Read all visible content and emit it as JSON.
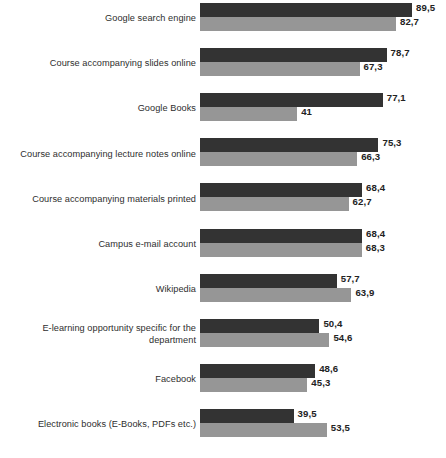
{
  "chart_data": {
    "type": "bar",
    "orientation": "horizontal",
    "title": "",
    "subtitle": "",
    "xlabel": "",
    "ylabel": "",
    "xlim": [
      0,
      100
    ],
    "grid": false,
    "legend": null,
    "decimal_separator": ",",
    "colors": {
      "series_1": "#333333",
      "series_2": "#969696",
      "background": "#ffffff",
      "label_text": "#2e2e2e",
      "value_text": "#222222"
    },
    "categories": [
      "Google search engine",
      "Course accompanying slides online",
      "Google Books",
      "Course accompanying lecture notes online",
      "Course accompanying materials printed",
      "Campus e-mail account",
      "Wikipedia",
      "E-learning opportunity specific for the department",
      "Facebook",
      "Electronic books (E-Books, PDFs etc.)"
    ],
    "series": [
      {
        "name": "series-1",
        "color": "#333333",
        "values": [
          89.5,
          78.7,
          77.1,
          75.3,
          68.4,
          68.4,
          57.7,
          50.4,
          48.6,
          39.5
        ],
        "labels": [
          "89,5",
          "78,7",
          "77,1",
          "75,3",
          "68,4",
          "68,4",
          "57,7",
          "50,4",
          "48,6",
          "39,5"
        ]
      },
      {
        "name": "series-2",
        "color": "#969696",
        "values": [
          82.7,
          67.3,
          41,
          66.3,
          62.7,
          68.3,
          63.9,
          54.6,
          45.3,
          53.5
        ],
        "labels": [
          "82,7",
          "67,3",
          "41",
          "66,3",
          "62,7",
          "68,3",
          "63,9",
          "54,6",
          "45,3",
          "53,5"
        ]
      }
    ]
  }
}
